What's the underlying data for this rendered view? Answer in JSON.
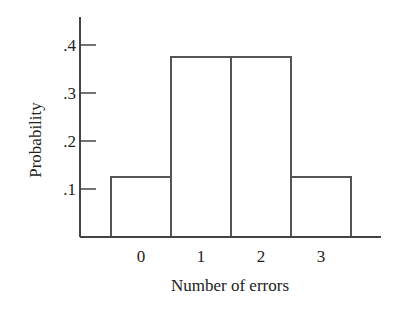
{
  "chart_data": {
    "type": "bar",
    "title": "",
    "xlabel": "Number of errors",
    "ylabel": "Probability",
    "categories": [
      "0",
      "1",
      "2",
      "3"
    ],
    "values": [
      0.125,
      0.375,
      0.375,
      0.125
    ],
    "ylim": [
      0,
      0.45
    ],
    "yticks": [
      0.1,
      0.2,
      0.3,
      0.4
    ],
    "ytick_labels": [
      ".1",
      ".2",
      ".3",
      ".4"
    ],
    "grid": false,
    "legend": null,
    "style": "histogram (adjacent unfilled bars)"
  },
  "colors": {
    "stroke": "#555555",
    "axis": "#444444",
    "text": "#222222",
    "background": "#ffffff"
  }
}
